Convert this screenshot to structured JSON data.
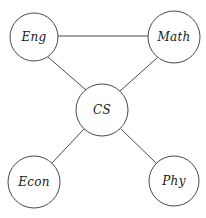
{
  "diagram": {
    "type": "node-link-graph",
    "background_color": "#ffffff",
    "stroke_color": "#4a4a4a",
    "label_color": "#1a1a1a",
    "node_fill_color": "#ffffff",
    "nodes": [
      {
        "id": "eng",
        "label": "Eng",
        "cx": 34,
        "cy": 37,
        "r": 24
      },
      {
        "id": "math",
        "label": "Math",
        "cx": 174,
        "cy": 37,
        "r": 26
      },
      {
        "id": "cs",
        "label": "CS",
        "cx": 102,
        "cy": 110,
        "r": 26
      },
      {
        "id": "econ",
        "label": "Econ",
        "cx": 34,
        "cy": 182,
        "r": 26
      },
      {
        "id": "phy",
        "label": "Phy",
        "cx": 174,
        "cy": 181,
        "r": 25
      }
    ],
    "edges": [
      {
        "id": "eng-math",
        "source": "eng",
        "target": "math",
        "x1": 58,
        "y1": 36,
        "x2": 148,
        "y2": 36
      },
      {
        "id": "eng-cs",
        "source": "eng",
        "target": "cs",
        "x1": 48,
        "y1": 57,
        "x2": 86,
        "y2": 90
      },
      {
        "id": "math-cs",
        "source": "math",
        "target": "cs",
        "x1": 157,
        "y1": 58,
        "x2": 120,
        "y2": 91
      },
      {
        "id": "cs-econ",
        "source": "cs",
        "target": "econ",
        "x1": 84,
        "y1": 129,
        "x2": 52,
        "y2": 163
      },
      {
        "id": "cs-phy",
        "source": "cs",
        "target": "phy",
        "x1": 121,
        "y1": 129,
        "x2": 156,
        "y2": 163
      }
    ]
  }
}
